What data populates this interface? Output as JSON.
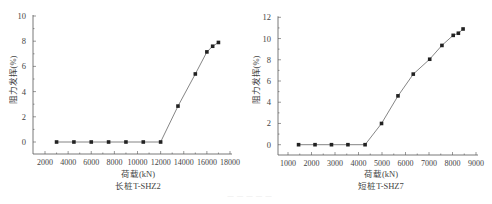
{
  "chart_data": [
    {
      "type": "line",
      "title": "长桩T-SHZ2",
      "xlabel": "荷载(kN)",
      "ylabel": "阻力发挥(%)",
      "xlim": [
        2000,
        18000
      ],
      "ylim": [
        -1,
        10
      ],
      "xticks": [
        2000,
        4000,
        6000,
        8000,
        10000,
        12000,
        14000,
        16000,
        18000
      ],
      "yticks": [
        0,
        2,
        4,
        6,
        8,
        10
      ],
      "grid": false,
      "legend": null,
      "marker": "square",
      "x": [
        3000,
        4500,
        6000,
        7500,
        9000,
        10500,
        12000,
        13500,
        15000,
        16000,
        16500,
        17000
      ],
      "y": [
        0,
        0,
        0,
        0,
        0,
        0,
        0,
        2.85,
        5.4,
        7.15,
        7.6,
        7.9
      ]
    },
    {
      "type": "line",
      "title": "短桩T-SHZ7",
      "xlabel": "荷载(kN)",
      "ylabel": "阻力发挥(%)",
      "xlim": [
        1000,
        9000
      ],
      "ylim": [
        -1,
        12
      ],
      "xticks": [
        1000,
        2000,
        3000,
        4000,
        5000,
        6000,
        7000,
        8000,
        9000
      ],
      "yticks": [
        0,
        2,
        4,
        6,
        8,
        10,
        12
      ],
      "grid": false,
      "legend": null,
      "marker": "square",
      "x": [
        1450,
        2150,
        2850,
        3550,
        4280,
        4980,
        5680,
        6330,
        7030,
        7550,
        8030,
        8250,
        8450
      ],
      "y": [
        0,
        0,
        0,
        0,
        0,
        2.0,
        4.6,
        6.65,
        8.05,
        9.35,
        10.3,
        10.5,
        10.9
      ]
    }
  ],
  "charts": [
    {
      "title": "长桩T-SHZ2",
      "xlabel": "荷载(kN)",
      "ylabel": "阻力发挥(%)",
      "xtick_labels": [
        "2000",
        "4000",
        "6000",
        "8000",
        "10000",
        "12000",
        "14000",
        "16000",
        "18000"
      ],
      "ytick_labels": [
        "0",
        "2",
        "4",
        "6",
        "8",
        "10"
      ]
    },
    {
      "title": "短桩T-SHZ7",
      "xlabel": "荷载(kN)",
      "ylabel": "阻力发挥(%)",
      "xtick_labels": [
        "1000",
        "2000",
        "3000",
        "4000",
        "5000",
        "6000",
        "7000",
        "8000",
        "9000"
      ],
      "ytick_labels": [
        "0",
        "2",
        "4",
        "6",
        "8",
        "10",
        "12"
      ]
    }
  ],
  "colors": {
    "line": "#777777",
    "marker": "#222222",
    "axis": "#555555",
    "text": "#444444"
  }
}
